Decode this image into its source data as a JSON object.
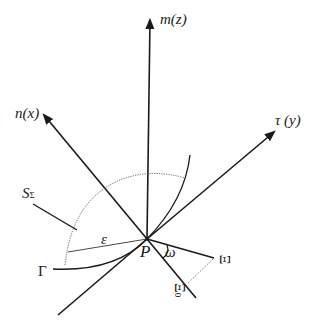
{
  "diagram": {
    "type": "3d-axis-geometry",
    "colors": {
      "line": "#1a1a1a",
      "dotted": "#555555",
      "background": "#ffffff"
    },
    "axes": [
      {
        "id": "m",
        "label": "m(z)"
      },
      {
        "id": "n",
        "label": "n(x)"
      },
      {
        "id": "tau",
        "label": "τ (y)"
      }
    ],
    "labels": {
      "origin": "P",
      "surface": "S",
      "surface_sub": "Σ",
      "curve": "Γ",
      "epsilon": "ε",
      "omega": "ω",
      "xi": "Ξ",
      "xi0": "Ξ",
      "xi0_sub": "0"
    }
  }
}
